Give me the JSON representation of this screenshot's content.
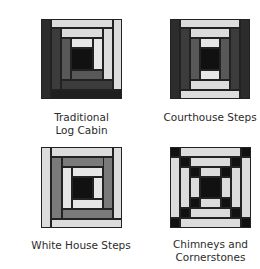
{
  "colors": {
    "black": "#111111",
    "dark": "#2c2c2c",
    "darker": "#1f1f1f",
    "darkmid": "#3c3c3c",
    "mid": "#585858",
    "midgray": "#7a7a7a",
    "light": "#dcdcdc",
    "lighter": "#e6e6e6"
  },
  "blocks": [
    {
      "id": "traditional-log-cabin",
      "caption_lines": [
        "Traditional",
        "Log Cabin"
      ],
      "box": {
        "x": 41,
        "y": 19,
        "w": 81,
        "h": 80
      },
      "caption_box": {
        "x": 41,
        "y": 111,
        "w": 81
      },
      "pieces": [
        {
          "x": 0,
          "y": 0,
          "w": 10,
          "h": 80,
          "c": "dark"
        },
        {
          "x": 10,
          "y": 0,
          "w": 62,
          "h": 9,
          "c": "light"
        },
        {
          "x": 72,
          "y": 0,
          "w": 9,
          "h": 71,
          "c": "light"
        },
        {
          "x": 10,
          "y": 71,
          "w": 71,
          "h": 9,
          "c": "darker"
        },
        {
          "x": 10,
          "y": 9,
          "w": 10,
          "h": 62,
          "c": "darkmid"
        },
        {
          "x": 20,
          "y": 9,
          "w": 42,
          "h": 10,
          "c": "light"
        },
        {
          "x": 62,
          "y": 9,
          "w": 10,
          "h": 52,
          "c": "light"
        },
        {
          "x": 20,
          "y": 61,
          "w": 52,
          "h": 10,
          "c": "darkmid"
        },
        {
          "x": 20,
          "y": 19,
          "w": 10,
          "h": 42,
          "c": "mid"
        },
        {
          "x": 30,
          "y": 19,
          "w": 22,
          "h": 10,
          "c": "lighter"
        },
        {
          "x": 52,
          "y": 19,
          "w": 10,
          "h": 32,
          "c": "lighter"
        },
        {
          "x": 30,
          "y": 51,
          "w": 32,
          "h": 10,
          "c": "mid"
        },
        {
          "x": 30,
          "y": 29,
          "w": 22,
          "h": 22,
          "c": "black"
        }
      ]
    },
    {
      "id": "courthouse-steps",
      "caption_lines": [
        "Courthouse Steps"
      ],
      "box": {
        "x": 170,
        "y": 19,
        "w": 80,
        "h": 80
      },
      "caption_box": {
        "x": 160,
        "y": 111,
        "w": 100
      },
      "pieces": [
        {
          "x": 0,
          "y": 0,
          "w": 10,
          "h": 80,
          "c": "dark"
        },
        {
          "x": 70,
          "y": 0,
          "w": 10,
          "h": 80,
          "c": "dark"
        },
        {
          "x": 10,
          "y": 0,
          "w": 60,
          "h": 9,
          "c": "light"
        },
        {
          "x": 10,
          "y": 71,
          "w": 60,
          "h": 9,
          "c": "light"
        },
        {
          "x": 10,
          "y": 9,
          "w": 10,
          "h": 62,
          "c": "darkmid"
        },
        {
          "x": 60,
          "y": 9,
          "w": 10,
          "h": 62,
          "c": "darkmid"
        },
        {
          "x": 20,
          "y": 9,
          "w": 40,
          "h": 10,
          "c": "light"
        },
        {
          "x": 20,
          "y": 61,
          "w": 40,
          "h": 10,
          "c": "light"
        },
        {
          "x": 20,
          "y": 19,
          "w": 10,
          "h": 42,
          "c": "mid"
        },
        {
          "x": 50,
          "y": 19,
          "w": 10,
          "h": 42,
          "c": "mid"
        },
        {
          "x": 30,
          "y": 19,
          "w": 20,
          "h": 10,
          "c": "lighter"
        },
        {
          "x": 30,
          "y": 51,
          "w": 20,
          "h": 10,
          "c": "lighter"
        },
        {
          "x": 30,
          "y": 29,
          "w": 20,
          "h": 22,
          "c": "black"
        }
      ]
    },
    {
      "id": "white-house-steps",
      "caption_lines": [
        "White House Steps"
      ],
      "box": {
        "x": 41,
        "y": 147,
        "w": 81,
        "h": 81
      },
      "caption_box": {
        "x": 31,
        "y": 239,
        "w": 100
      },
      "pieces": [
        {
          "x": 0,
          "y": 0,
          "w": 10,
          "h": 81,
          "c": "light"
        },
        {
          "x": 10,
          "y": 0,
          "w": 62,
          "h": 10,
          "c": "light"
        },
        {
          "x": 72,
          "y": 0,
          "w": 9,
          "h": 72,
          "c": "light"
        },
        {
          "x": 10,
          "y": 72,
          "w": 71,
          "h": 9,
          "c": "light"
        },
        {
          "x": 10,
          "y": 10,
          "w": 11,
          "h": 62,
          "c": "midgray"
        },
        {
          "x": 21,
          "y": 10,
          "w": 51,
          "h": 10,
          "c": "midgray"
        },
        {
          "x": 62,
          "y": 10,
          "w": 10,
          "h": 52,
          "c": "midgray"
        },
        {
          "x": 21,
          "y": 62,
          "w": 51,
          "h": 10,
          "c": "midgray"
        },
        {
          "x": 21,
          "y": 20,
          "w": 10,
          "h": 42,
          "c": "lighter"
        },
        {
          "x": 31,
          "y": 20,
          "w": 31,
          "h": 10,
          "c": "lighter"
        },
        {
          "x": 52,
          "y": 30,
          "w": 10,
          "h": 22,
          "c": "lighter"
        },
        {
          "x": 31,
          "y": 52,
          "w": 31,
          "h": 10,
          "c": "lighter"
        },
        {
          "x": 31,
          "y": 30,
          "w": 21,
          "h": 22,
          "c": "black"
        }
      ]
    },
    {
      "id": "chimneys-and-cornerstones",
      "caption_lines": [
        "Chimneys and",
        "Cornerstones"
      ],
      "box": {
        "x": 170,
        "y": 147,
        "w": 81,
        "h": 81
      },
      "caption_box": {
        "x": 160,
        "y": 238,
        "w": 101
      },
      "pieces": [
        {
          "x": 0,
          "y": 0,
          "w": 10,
          "h": 10,
          "c": "black"
        },
        {
          "x": 71,
          "y": 0,
          "w": 10,
          "h": 10,
          "c": "black"
        },
        {
          "x": 0,
          "y": 71,
          "w": 10,
          "h": 10,
          "c": "black"
        },
        {
          "x": 71,
          "y": 71,
          "w": 10,
          "h": 10,
          "c": "black"
        },
        {
          "x": 10,
          "y": 0,
          "w": 61,
          "h": 10,
          "c": "light"
        },
        {
          "x": 10,
          "y": 71,
          "w": 61,
          "h": 10,
          "c": "light"
        },
        {
          "x": 0,
          "y": 10,
          "w": 10,
          "h": 61,
          "c": "light"
        },
        {
          "x": 71,
          "y": 10,
          "w": 10,
          "h": 61,
          "c": "light"
        },
        {
          "x": 10,
          "y": 10,
          "w": 10,
          "h": 10,
          "c": "black"
        },
        {
          "x": 61,
          "y": 10,
          "w": 10,
          "h": 10,
          "c": "black"
        },
        {
          "x": 10,
          "y": 61,
          "w": 10,
          "h": 10,
          "c": "black"
        },
        {
          "x": 61,
          "y": 61,
          "w": 10,
          "h": 10,
          "c": "black"
        },
        {
          "x": 20,
          "y": 10,
          "w": 41,
          "h": 10,
          "c": "light"
        },
        {
          "x": 20,
          "y": 61,
          "w": 41,
          "h": 10,
          "c": "light"
        },
        {
          "x": 10,
          "y": 20,
          "w": 10,
          "h": 41,
          "c": "light"
        },
        {
          "x": 61,
          "y": 20,
          "w": 10,
          "h": 41,
          "c": "light"
        },
        {
          "x": 20,
          "y": 20,
          "w": 10,
          "h": 10,
          "c": "black"
        },
        {
          "x": 51,
          "y": 20,
          "w": 10,
          "h": 10,
          "c": "black"
        },
        {
          "x": 20,
          "y": 51,
          "w": 10,
          "h": 10,
          "c": "black"
        },
        {
          "x": 51,
          "y": 51,
          "w": 10,
          "h": 10,
          "c": "black"
        },
        {
          "x": 30,
          "y": 20,
          "w": 21,
          "h": 10,
          "c": "light"
        },
        {
          "x": 30,
          "y": 51,
          "w": 21,
          "h": 10,
          "c": "light"
        },
        {
          "x": 20,
          "y": 30,
          "w": 10,
          "h": 21,
          "c": "light"
        },
        {
          "x": 51,
          "y": 30,
          "w": 10,
          "h": 21,
          "c": "light"
        },
        {
          "x": 30,
          "y": 30,
          "w": 21,
          "h": 21,
          "c": "black"
        }
      ]
    }
  ]
}
